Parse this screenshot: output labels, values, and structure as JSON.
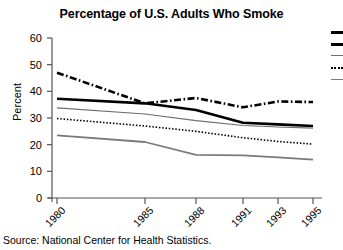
{
  "chart_data": {
    "type": "line",
    "title": "Percentage of U.S. Adults Who Smoke",
    "xlabel": "",
    "ylabel": "Percent",
    "ylim": [
      0,
      60
    ],
    "yticks": [
      0,
      10,
      20,
      30,
      40,
      50,
      60
    ],
    "xlim": [
      1980,
      1995
    ],
    "xticks": [
      1980,
      1985,
      1988,
      1991,
      1993,
      1995
    ],
    "xtick_labels": [
      "1980",
      "1985",
      "1988",
      "1991",
      "1993",
      "1995"
    ],
    "grid": false,
    "legend_position": "right",
    "legend_cropped": true,
    "x": [
      1980,
      1985,
      1988,
      1991,
      1993,
      1995
    ],
    "series": [
      {
        "name": "series-dash-dot",
        "style": "dash-dot",
        "color": "#000000",
        "width": 2.6,
        "values": [
          47.0,
          35.5,
          37.5,
          34.0,
          36.2,
          36.0
        ]
      },
      {
        "name": "series-thick-solid",
        "style": "solid",
        "color": "#000000",
        "width": 2.6,
        "values": [
          37.2,
          35.5,
          33.0,
          28.2,
          27.6,
          27.0
        ]
      },
      {
        "name": "series-thin-gray",
        "style": "solid",
        "color": "#6e6e6e",
        "width": 1.1,
        "values": [
          33.8,
          31.5,
          29.0,
          27.2,
          26.6,
          26.2
        ]
      },
      {
        "name": "series-dotted",
        "style": "dotted",
        "color": "#000000",
        "width": 1.6,
        "values": [
          29.8,
          27.0,
          25.0,
          22.6,
          21.2,
          20.2
        ]
      },
      {
        "name": "series-gray-low",
        "style": "solid",
        "color": "#7a7a7a",
        "width": 1.8,
        "values": [
          23.5,
          21.0,
          16.2,
          16.0,
          15.2,
          14.4
        ]
      }
    ],
    "source": "Source: National Center for Health Statistics.",
    "legend_items": [
      {
        "label": "",
        "style": "solid-thick",
        "color": "#000000"
      },
      {
        "label": "",
        "style": "solid-thick",
        "color": "#000000"
      },
      {
        "label": "",
        "style": "solid",
        "color": "#6e6e6e"
      },
      {
        "label": "",
        "style": "dotted",
        "color": "#000000"
      },
      {
        "label": "",
        "style": "solid",
        "color": "#7a7a7a"
      }
    ]
  }
}
